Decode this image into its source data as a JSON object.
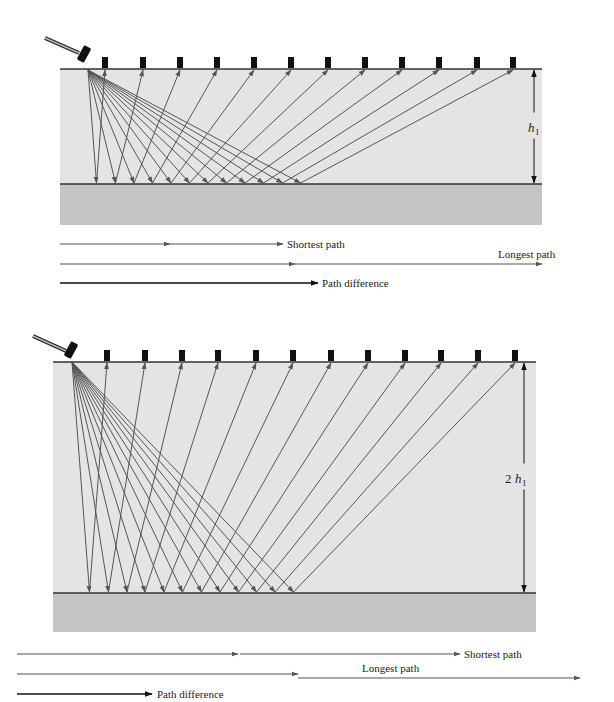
{
  "figure": {
    "colors": {
      "upper_layer": "#e4e4e4",
      "lower_layer": "#c4c4c4",
      "ray": "#555555",
      "ink": "#111111",
      "geophone": "#111111"
    }
  },
  "panels": [
    {
      "id": "top",
      "thickness_label": {
        "symbol": "h",
        "subscript": "1",
        "prefix": ""
      },
      "surface_y": 69,
      "reflector_y": 184,
      "lower_bottom_y": 225,
      "x_left": 60,
      "x_right": 542,
      "source": {
        "x": 88,
        "y": 70
      },
      "hammer": {
        "handle": [
          45,
          38,
          79,
          53
        ],
        "head_cx": 84,
        "head_cy": 54,
        "angle": 28
      },
      "geophones_x": [
        105,
        143,
        180,
        217,
        254,
        291,
        328,
        365,
        402,
        439,
        477,
        513
      ],
      "dimension_x": 534,
      "legend": {
        "shortest": {
          "label": "Shortest path",
          "y": 244,
          "seg1": [
            60,
            170
          ],
          "seg2": [
            170,
            283
          ],
          "label_x": 287
        },
        "longest": {
          "label": "Longest path",
          "y": 264,
          "seg1": [
            60,
            295
          ],
          "seg2": [
            295,
            542
          ],
          "label_x": 498,
          "label_y": 258
        },
        "difference": {
          "label": "Path difference",
          "y": 283,
          "seg": [
            60,
            318
          ],
          "label_x": 322
        }
      }
    },
    {
      "id": "bottom",
      "thickness_label": {
        "symbol": "h",
        "subscript": "1",
        "prefix": "2"
      },
      "surface_y": 362,
      "reflector_y": 593,
      "lower_bottom_y": 632,
      "x_left": 53,
      "x_right": 536,
      "source": {
        "x": 72,
        "y": 362
      },
      "hammer": {
        "handle": [
          33,
          336,
          66,
          351
        ],
        "head_cx": 71,
        "head_cy": 350,
        "angle": 28
      },
      "geophones_x": [
        107,
        145,
        182,
        218,
        256,
        293,
        331,
        368,
        405,
        441,
        478,
        515
      ],
      "dimension_x": 524,
      "legend": {
        "shortest": {
          "label": "Shortest path",
          "y": 654,
          "seg1": [
            17,
            238
          ],
          "seg2": [
            240,
            460
          ],
          "label_x": 464
        },
        "longest": {
          "label": "Longest path",
          "y": 674,
          "seg1": [
            17,
            298
          ],
          "seg2": [
            298,
            580
          ],
          "y2": 678,
          "label_x": 362,
          "label_y": 672
        },
        "difference": {
          "label": "Path difference",
          "y": 694,
          "seg": [
            17,
            152
          ],
          "label_x": 157
        }
      }
    }
  ]
}
